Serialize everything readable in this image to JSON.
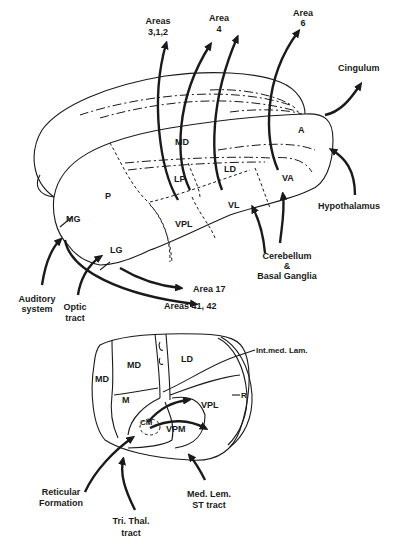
{
  "figure": {
    "upper_view": {
      "nuclei": [
        "MD",
        "A",
        "LP",
        "LD",
        "VA",
        "P",
        "VL",
        "VPL",
        "MG",
        "LG"
      ],
      "outputs": [
        {
          "label": "Areas 3,1,2",
          "line1": "Areas",
          "line2": "3,1,2"
        },
        {
          "label": "Area 4",
          "line1": "Area",
          "line2": "4"
        },
        {
          "label": "Area 6",
          "line1": "Area",
          "line2": "6"
        },
        {
          "label": "Cingulum"
        },
        {
          "label": "Area 17"
        },
        {
          "label": "Areas 41, 42"
        }
      ],
      "inputs": [
        {
          "label": "Hypothalamus"
        },
        {
          "label": "Cerebellum & Basal Ganglia",
          "line1": "Cerebellum",
          "line2": "&",
          "line3": "Basal Ganglia"
        },
        {
          "label": "Auditory system",
          "line1": "Auditory",
          "line2": "system"
        },
        {
          "label": "Optic tract",
          "line1": "Optic",
          "line2": "tract"
        }
      ]
    },
    "cross_section": {
      "nuclei": [
        "MD",
        "MD",
        "LD",
        "M",
        "VPL",
        "CM",
        "VPM"
      ],
      "structures": [
        {
          "label": "Int.med. Lam."
        },
        {
          "label": "R"
        }
      ],
      "inputs": [
        {
          "label": "Reticular Formation",
          "line1": "Reticular",
          "line2": "Formation"
        },
        {
          "label": "Tri. Thal. tract",
          "line1": "Tri. Thal.",
          "line2": "tract"
        },
        {
          "label": "Med. Lem. ST tract",
          "line1": "Med. Lem.",
          "line2": "ST tract"
        }
      ]
    }
  }
}
